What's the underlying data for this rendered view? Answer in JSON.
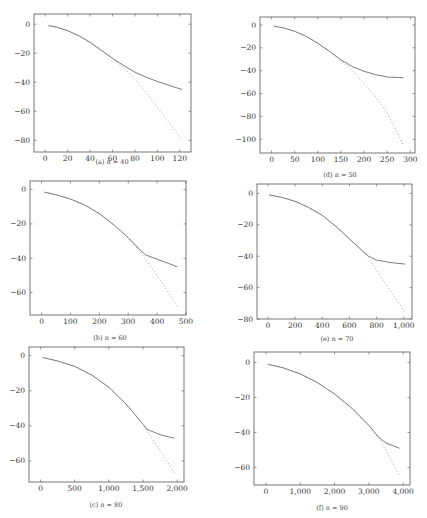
{
  "chart_data": [
    {
      "id": "a",
      "type": "line",
      "caption": "(a) n = 40",
      "xlim": [
        -10,
        130
      ],
      "ylim": [
        -88,
        7
      ],
      "xticks": [
        0,
        20,
        40,
        60,
        80,
        100,
        120
      ],
      "xtick_labels": [
        "0",
        "20",
        "40",
        "60",
        "80",
        "100",
        "120"
      ],
      "yticks": [
        0,
        -20,
        -40,
        -60,
        -80
      ],
      "ytick_labels": [
        "0",
        "−20",
        "−40",
        "−60",
        "−80"
      ],
      "series": [
        {
          "name": "solid",
          "style": "solid",
          "x": [
            3,
            10,
            20,
            30,
            40,
            50,
            60,
            70,
            80,
            90,
            100,
            110,
            122
          ],
          "y": [
            -1,
            -2,
            -4.5,
            -8,
            -12.5,
            -18,
            -23.5,
            -28.5,
            -33,
            -36.5,
            -39.5,
            -42,
            -45
          ]
        },
        {
          "name": "dashed",
          "style": "dashed",
          "x": [
            3,
            10,
            20,
            30,
            40,
            50,
            60,
            70,
            80,
            90,
            100,
            110,
            122
          ],
          "y": [
            -1,
            -2,
            -4.5,
            -8,
            -12.5,
            -18,
            -23.5,
            -30,
            -38,
            -47,
            -57,
            -67.5,
            -80
          ]
        }
      ]
    },
    {
      "id": "d",
      "type": "line",
      "caption": "(d) n = 50",
      "xlim": [
        -25,
        310
      ],
      "ylim": [
        -112,
        7
      ],
      "xticks": [
        0,
        50,
        100,
        150,
        200,
        250,
        300
      ],
      "xtick_labels": [
        "0",
        "50",
        "100",
        "150",
        "200",
        "250",
        "300"
      ],
      "yticks": [
        0,
        -20,
        -40,
        -60,
        -80,
        -100
      ],
      "ytick_labels": [
        "0",
        "−20",
        "−40",
        "−60",
        "−80",
        "−100"
      ],
      "series": [
        {
          "name": "solid",
          "style": "solid",
          "x": [
            5,
            25,
            50,
            75,
            100,
            125,
            150,
            175,
            200,
            225,
            250,
            285
          ],
          "y": [
            -1,
            -2.5,
            -5.5,
            -10,
            -16,
            -23,
            -30.5,
            -36.5,
            -40.5,
            -43.5,
            -45.5,
            -46
          ]
        },
        {
          "name": "dashed",
          "style": "dashed",
          "x": [
            5,
            25,
            50,
            75,
            100,
            125,
            150,
            175,
            200,
            225,
            250,
            285
          ],
          "y": [
            -1,
            -2.5,
            -5.5,
            -10,
            -16,
            -23,
            -31,
            -40,
            -51,
            -63,
            -77,
            -105
          ]
        }
      ]
    },
    {
      "id": "b",
      "type": "line",
      "caption": "(b) n = 60",
      "xlim": [
        -40,
        500
      ],
      "ylim": [
        -73,
        5
      ],
      "xticks": [
        0,
        100,
        200,
        300,
        400,
        500
      ],
      "xtick_labels": [
        "0",
        "100",
        "200",
        "300",
        "400",
        "500"
      ],
      "yticks": [
        0,
        -20,
        -40,
        -60
      ],
      "ytick_labels": [
        "0",
        "−20",
        "−40",
        "−60"
      ],
      "series": [
        {
          "name": "solid",
          "style": "solid",
          "x": [
            10,
            50,
            100,
            150,
            200,
            250,
            300,
            340,
            360,
            400,
            440,
            470
          ],
          "y": [
            -1.5,
            -3,
            -5.5,
            -9,
            -14,
            -20.5,
            -28,
            -35,
            -38,
            -40.5,
            -43,
            -45
          ]
        },
        {
          "name": "dashed",
          "style": "dashed",
          "x": [
            10,
            50,
            100,
            150,
            200,
            250,
            300,
            340,
            360,
            400,
            440,
            470
          ],
          "y": [
            -1.5,
            -3,
            -5.5,
            -9,
            -14,
            -20.5,
            -28,
            -36,
            -40.5,
            -50,
            -60,
            -68
          ]
        }
      ]
    },
    {
      "id": "e",
      "type": "line",
      "caption": "(e) n = 70",
      "xlim": [
        -80,
        1060
      ],
      "ylim": [
        -80,
        6
      ],
      "xticks": [
        0,
        200,
        400,
        600,
        800,
        1000
      ],
      "xtick_labels": [
        "0",
        "200",
        "400",
        "600",
        "800",
        "1,000"
      ],
      "yticks": [
        0,
        -20,
        -40,
        -60,
        -80
      ],
      "ytick_labels": [
        "0",
        "−20",
        "−40",
        "−60",
        "−80"
      ],
      "series": [
        {
          "name": "solid",
          "style": "solid",
          "x": [
            10,
            100,
            200,
            300,
            400,
            500,
            600,
            700,
            740,
            800,
            900,
            1010
          ],
          "y": [
            -1,
            -2.5,
            -5,
            -9,
            -14,
            -21,
            -29,
            -37,
            -40,
            -42.5,
            -44,
            -45
          ]
        },
        {
          "name": "dashed",
          "style": "dashed",
          "x": [
            10,
            100,
            200,
            300,
            400,
            500,
            600,
            700,
            740,
            800,
            900,
            1010
          ],
          "y": [
            -1,
            -2.5,
            -5,
            -9,
            -14,
            -21,
            -29,
            -37,
            -41,
            -49,
            -62,
            -76
          ]
        }
      ]
    },
    {
      "id": "c",
      "type": "line",
      "caption": "(c) n = 80",
      "xlim": [
        -170,
        2100
      ],
      "ylim": [
        -72,
        5
      ],
      "xticks": [
        0,
        500,
        1000,
        1500,
        2000
      ],
      "xtick_labels": [
        "0",
        "500",
        "1,000",
        "1,500",
        "2,000"
      ],
      "yticks": [
        0,
        -20,
        -40,
        -60
      ],
      "ytick_labels": [
        "0",
        "−20",
        "−40",
        "−60"
      ],
      "series": [
        {
          "name": "solid",
          "style": "solid",
          "x": [
            30,
            250,
            500,
            750,
            1000,
            1250,
            1500,
            1560,
            1750,
            1960
          ],
          "y": [
            -1,
            -3,
            -6,
            -11,
            -18,
            -27.5,
            -39,
            -42,
            -45,
            -47
          ]
        },
        {
          "name": "dashed",
          "style": "dashed",
          "x": [
            30,
            250,
            500,
            750,
            1000,
            1250,
            1500,
            1560,
            1750,
            1960
          ],
          "y": [
            -1,
            -3,
            -6,
            -11,
            -18,
            -27.5,
            -39,
            -43,
            -54,
            -67
          ]
        }
      ]
    },
    {
      "id": "f",
      "type": "line",
      "caption": "(f) n = 90",
      "xlim": [
        -350,
        4200
      ],
      "ylim": [
        -70,
        6
      ],
      "xticks": [
        0,
        1000,
        2000,
        3000,
        4000
      ],
      "xtick_labels": [
        "0",
        "1,000",
        "2,000",
        "3,000",
        "4,000"
      ],
      "yticks": [
        0,
        -20,
        -40,
        -60
      ],
      "ytick_labels": [
        "0",
        "−20",
        "−40",
        "−60"
      ],
      "series": [
        {
          "name": "solid",
          "style": "solid",
          "x": [
            50,
            500,
            1000,
            1500,
            2000,
            2500,
            3000,
            3300,
            3500,
            3900
          ],
          "y": [
            -1,
            -3,
            -6.5,
            -11.5,
            -18,
            -26,
            -36,
            -43,
            -46,
            -49
          ]
        },
        {
          "name": "dashed",
          "style": "dashed",
          "x": [
            50,
            500,
            1000,
            1500,
            2000,
            2500,
            3000,
            3300,
            3500,
            3900
          ],
          "y": [
            -1,
            -3,
            -6.5,
            -11.5,
            -18,
            -26,
            -36,
            -43.5,
            -50,
            -65
          ]
        }
      ]
    }
  ],
  "layout": {
    "panels": [
      {
        "id": "a",
        "frame": [
          34,
          14,
          191,
          152
        ],
        "caption_y": 154,
        "caption_x": 112
      },
      {
        "id": "d",
        "frame": [
          260,
          17,
          415,
          153
        ],
        "caption_y": 167,
        "caption_x": 340
      },
      {
        "id": "b",
        "frame": [
          30,
          181,
          186,
          315
        ],
        "caption_y": 330,
        "caption_x": 110
      },
      {
        "id": "e",
        "frame": [
          257,
          184,
          412,
          319
        ],
        "caption_y": 331,
        "caption_x": 337
      },
      {
        "id": "c",
        "frame": [
          29,
          347,
          184,
          482
        ],
        "caption_y": 497,
        "caption_x": 106
      },
      {
        "id": "f",
        "frame": [
          254,
          352,
          410,
          485
        ],
        "caption_y": 500,
        "caption_x": 332
      }
    ]
  }
}
